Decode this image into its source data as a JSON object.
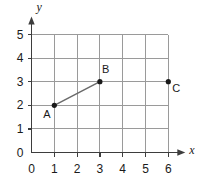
{
  "chart_data": {
    "type": "scatter",
    "title": "",
    "xlabel": "x",
    "ylabel": "y",
    "xlim": [
      0,
      6
    ],
    "ylim": [
      0,
      5
    ],
    "grid": true,
    "legend": null,
    "x_ticks": [
      "0",
      "1",
      "2",
      "3",
      "4",
      "5",
      "6"
    ],
    "y_ticks": [
      "0",
      "1",
      "2",
      "3",
      "4",
      "5"
    ],
    "x_tick_values": [
      0,
      1,
      2,
      3,
      4,
      5,
      6
    ],
    "y_tick_values": [
      0,
      1,
      2,
      3,
      4,
      5
    ],
    "points": [
      {
        "label": "A",
        "x": 1,
        "y": 2,
        "label_position": "below-left"
      },
      {
        "label": "B",
        "x": 3,
        "y": 3,
        "label_position": "above-left"
      },
      {
        "label": "C",
        "x": 6,
        "y": 3,
        "label_position": "below-right"
      }
    ],
    "segments": [
      {
        "from": "A",
        "to": "B",
        "x1": 1,
        "y1": 2,
        "x2": 3,
        "y2": 3
      }
    ],
    "annotations": []
  },
  "axes": {
    "x_axis_name": "x",
    "y_axis_name": "y",
    "origin_label": "0"
  },
  "colors": {
    "background": "#ffffff",
    "gridline": "#9a9a9a",
    "axis": "#3d3d3d",
    "segment": "#6a6a6a",
    "point": "#1a1a1a",
    "text": "#1a1a1a"
  }
}
